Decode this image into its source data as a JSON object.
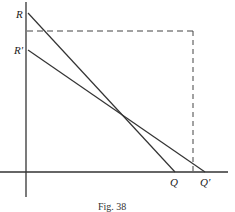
{
  "figure": {
    "caption": "Fig. 38",
    "labels": {
      "R": "R",
      "R_prime": "R′",
      "Q": "Q",
      "Q_prime": "Q′"
    },
    "colors": {
      "ink": "#333333",
      "background": "#ffffff"
    }
  },
  "diagram": {
    "axes": {
      "origin": [
        26,
        172
      ],
      "vertical": {
        "x": 26,
        "y_top": 2,
        "y_bottom": 197
      },
      "horizontal": {
        "y": 172,
        "x_left": 0,
        "x_right": 228
      }
    },
    "lines": [
      {
        "name": "RQ",
        "from": [
          28,
          13
        ],
        "to": [
          175,
          172
        ],
        "style": "solid"
      },
      {
        "name": "R'Q'",
        "from": [
          28,
          50
        ],
        "to": [
          205,
          172
        ],
        "style": "solid"
      }
    ],
    "dashed_box": {
      "top_y": 31,
      "left_x": 27,
      "right_x": 193,
      "bottom_y": 172
    }
  }
}
